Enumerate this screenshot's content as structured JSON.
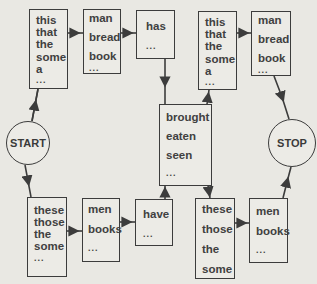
{
  "diagram": {
    "type": "finite-state grammar",
    "start_label": "START",
    "stop_label": "STOP",
    "boxes": {
      "top_det1": [
        "this",
        "that",
        "the",
        "some",
        "a",
        "..."
      ],
      "top_noun1": [
        "man",
        "bread",
        "book",
        "..."
      ],
      "top_aux": [
        "has",
        "..."
      ],
      "top_det2": [
        "this",
        "that",
        "the",
        "some",
        "a",
        "..."
      ],
      "top_noun2": [
        "man",
        "bread",
        "book",
        "..."
      ],
      "verb": [
        "brought",
        "eaten",
        "seen",
        "..."
      ],
      "bot_det1": [
        "these",
        "those",
        "the",
        "some",
        "..."
      ],
      "bot_noun1": [
        "men",
        "books",
        "..."
      ],
      "bot_aux": [
        "have",
        "..."
      ],
      "bot_det2": [
        "these",
        "those",
        "the",
        "some"
      ],
      "bot_noun2": [
        "men",
        "books",
        "..."
      ]
    },
    "edges": [
      [
        "START",
        "top_det1"
      ],
      [
        "top_det1",
        "top_noun1"
      ],
      [
        "top_noun1",
        "top_aux"
      ],
      [
        "top_aux",
        "verb"
      ],
      [
        "START",
        "bot_det1"
      ],
      [
        "bot_det1",
        "bot_noun1"
      ],
      [
        "bot_noun1",
        "bot_aux"
      ],
      [
        "bot_aux",
        "verb"
      ],
      [
        "verb",
        "top_det2"
      ],
      [
        "verb",
        "bot_det2"
      ],
      [
        "top_det2",
        "top_noun2"
      ],
      [
        "top_noun2",
        "STOP"
      ],
      [
        "bot_det2",
        "bot_noun2"
      ],
      [
        "bot_noun2",
        "STOP"
      ]
    ],
    "colors": {
      "line": "#3c3c3c",
      "background": "#e9e8e3"
    }
  }
}
